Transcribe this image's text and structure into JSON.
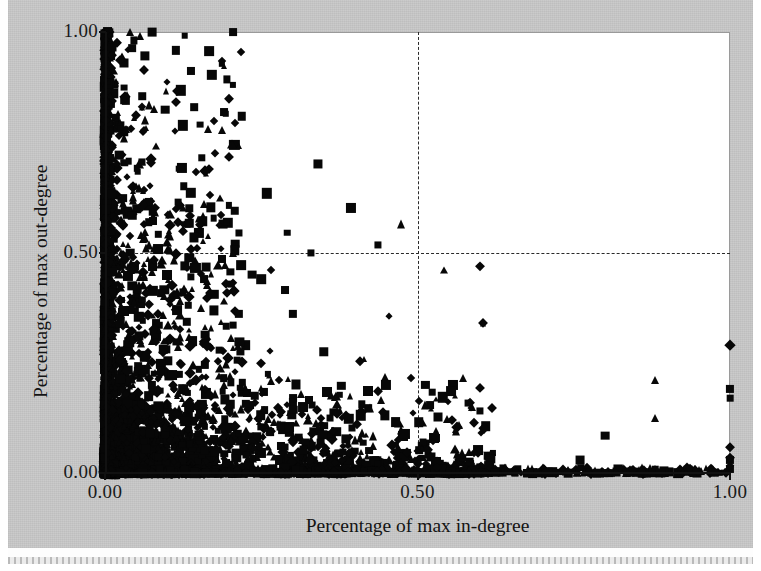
{
  "figure": {
    "background_color": "#c9c9c9",
    "plot_background_color": "#ffffff",
    "marker_color": "#070707",
    "gridline_color": "#2a2a2a"
  },
  "chart_data": {
    "type": "scatter",
    "title": "",
    "xlabel": "Percentage of max in-degree",
    "ylabel": "Percentage of max out-degree",
    "xlim": [
      0.0,
      1.0
    ],
    "ylim": [
      0.0,
      1.0
    ],
    "xticks": [
      "0.00",
      "0.50",
      "1.00"
    ],
    "yticks": [
      "0.00",
      "0.50",
      "1.00"
    ],
    "xtick_values": [
      0.0,
      0.5,
      1.0
    ],
    "ytick_values": [
      0.0,
      0.5,
      1.0
    ],
    "grid": true,
    "gridlines": {
      "x": [
        0.5
      ],
      "y": [
        0.5
      ],
      "style": "dashed"
    },
    "legend": "none",
    "marker_shapes": [
      "square",
      "diamond",
      "triangle"
    ],
    "series": [
      {
        "name": "square",
        "shape": "square",
        "points": [
          [
            0.0,
            1.0
          ],
          [
            0.004,
            1.0
          ],
          [
            0.075,
            1.0
          ],
          [
            0.205,
            1.0
          ],
          [
            0.03,
            0.93
          ],
          [
            0.03,
            0.845
          ],
          [
            0.03,
            0.775
          ],
          [
            0.205,
            0.88
          ],
          [
            0.152,
            0.79
          ],
          [
            0.0,
            0.76
          ],
          [
            0.0,
            0.745
          ],
          [
            0.003,
            0.7
          ],
          [
            0.118,
            0.69
          ],
          [
            0.34,
            0.7
          ],
          [
            0.208,
            0.595
          ],
          [
            0.0,
            0.64
          ],
          [
            0.026,
            0.62
          ],
          [
            0.068,
            0.605
          ],
          [
            0.135,
            0.6
          ],
          [
            0.0,
            0.57
          ],
          [
            0.15,
            0.545
          ],
          [
            0.208,
            0.52
          ],
          [
            0.208,
            0.505
          ],
          [
            0.0,
            0.505
          ],
          [
            0.04,
            0.5
          ],
          [
            0.33,
            0.5
          ],
          [
            0.128,
            0.47
          ],
          [
            0.0,
            0.455
          ],
          [
            0.158,
            0.44
          ],
          [
            0.235,
            0.45
          ],
          [
            0.25,
            0.44
          ],
          [
            0.0,
            0.42
          ],
          [
            0.095,
            0.415
          ],
          [
            0.175,
            0.405
          ],
          [
            0.05,
            0.395
          ],
          [
            0.0,
            0.38
          ],
          [
            0.115,
            0.37
          ],
          [
            0.3,
            0.36
          ],
          [
            0.0,
            0.35
          ],
          [
            0.06,
            0.345
          ],
          [
            0.205,
            0.335
          ],
          [
            0.0,
            0.32
          ],
          [
            0.082,
            0.31
          ],
          [
            0.14,
            0.3
          ],
          [
            0.0,
            0.295
          ],
          [
            0.225,
            0.29
          ],
          [
            0.03,
            0.28
          ],
          [
            0.35,
            0.275
          ],
          [
            0.0,
            0.265
          ],
          [
            0.1,
            0.255
          ],
          [
            0.16,
            0.245
          ],
          [
            0.0,
            0.235
          ],
          [
            0.055,
            0.23
          ],
          [
            0.26,
            0.225
          ],
          [
            0.19,
            0.215
          ],
          [
            0.0,
            0.205
          ],
          [
            0.075,
            0.2
          ],
          [
            0.125,
            0.19
          ],
          [
            0.42,
            0.185
          ],
          [
            0.0,
            0.18
          ],
          [
            0.24,
            0.175
          ],
          [
            0.04,
            0.165
          ],
          [
            0.3,
            0.16
          ],
          [
            0.155,
            0.155
          ],
          [
            0.0,
            0.15
          ],
          [
            0.09,
            0.145
          ],
          [
            0.2,
            0.14
          ],
          [
            0.52,
            0.155
          ],
          [
            0.0,
            0.13
          ],
          [
            0.06,
            0.125
          ],
          [
            0.36,
            0.125
          ],
          [
            0.14,
            0.118
          ],
          [
            0.0,
            0.11
          ],
          [
            0.25,
            0.105
          ],
          [
            0.105,
            0.1
          ],
          [
            0.18,
            0.095
          ],
          [
            0.0,
            0.09
          ],
          [
            0.045,
            0.085
          ],
          [
            0.31,
            0.08
          ],
          [
            0.8,
            0.085
          ],
          [
            0.0,
            0.075
          ],
          [
            0.13,
            0.07
          ],
          [
            0.22,
            0.065
          ],
          [
            0.07,
            0.06
          ],
          [
            0.0,
            0.055
          ],
          [
            0.165,
            0.05
          ],
          [
            0.4,
            0.05
          ],
          [
            0.62,
            0.045
          ],
          [
            0.0,
            0.04
          ],
          [
            0.095,
            0.035
          ],
          [
            0.28,
            0.03
          ],
          [
            0.76,
            0.03
          ],
          [
            0.0,
            0.025
          ],
          [
            0.05,
            0.02
          ],
          [
            0.2,
            0.018
          ],
          [
            0.34,
            0.015
          ],
          [
            0.48,
            0.012
          ],
          [
            0.56,
            0.01
          ],
          [
            0.66,
            0.01
          ],
          [
            0.88,
            0.008
          ],
          [
            1.0,
            0.19
          ],
          [
            1.0,
            0.17
          ],
          [
            1.0,
            0.03
          ],
          [
            1.0,
            0.01
          ],
          [
            0.015,
            0.88
          ],
          [
            0.015,
            0.69
          ],
          [
            0.015,
            0.53
          ],
          [
            0.015,
            0.33
          ],
          [
            0.008,
            0.96
          ],
          [
            0.008,
            0.6
          ],
          [
            0.008,
            0.43
          ],
          [
            0.008,
            0.215
          ]
        ]
      },
      {
        "name": "diamond",
        "shape": "diamond",
        "points": [
          [
            0.0,
            1.0
          ],
          [
            0.0,
            0.96
          ],
          [
            0.0,
            0.905
          ],
          [
            0.0,
            0.86
          ],
          [
            0.0,
            0.82
          ],
          [
            0.0,
            0.79
          ],
          [
            0.0,
            0.74
          ],
          [
            0.0,
            0.7
          ],
          [
            0.0,
            0.665
          ],
          [
            0.0,
            0.63
          ],
          [
            0.0,
            0.6
          ],
          [
            0.0,
            0.56
          ],
          [
            0.0,
            0.53
          ],
          [
            0.0,
            0.495
          ],
          [
            0.0,
            0.465
          ],
          [
            0.0,
            0.43
          ],
          [
            0.0,
            0.4
          ],
          [
            0.0,
            0.37
          ],
          [
            0.0,
            0.34
          ],
          [
            0.0,
            0.31
          ],
          [
            0.0,
            0.28
          ],
          [
            0.0,
            0.25
          ],
          [
            0.0,
            0.22
          ],
          [
            0.0,
            0.195
          ],
          [
            0.0,
            0.165
          ],
          [
            0.0,
            0.14
          ],
          [
            0.0,
            0.115
          ],
          [
            0.0,
            0.09
          ],
          [
            0.0,
            0.065
          ],
          [
            0.0,
            0.04
          ],
          [
            0.0,
            0.018
          ],
          [
            0.028,
            0.72
          ],
          [
            0.028,
            0.56
          ],
          [
            0.045,
            0.49
          ],
          [
            0.06,
            0.455
          ],
          [
            0.072,
            0.42
          ],
          [
            0.04,
            0.385
          ],
          [
            0.085,
            0.36
          ],
          [
            0.055,
            0.33
          ],
          [
            0.1,
            0.3
          ],
          [
            0.068,
            0.275
          ],
          [
            0.12,
            0.25
          ],
          [
            0.09,
            0.23
          ],
          [
            0.145,
            0.21
          ],
          [
            0.11,
            0.19
          ],
          [
            0.17,
            0.175
          ],
          [
            0.135,
            0.16
          ],
          [
            0.195,
            0.145
          ],
          [
            0.16,
            0.13
          ],
          [
            0.23,
            0.12
          ],
          [
            0.185,
            0.105
          ],
          [
            0.265,
            0.095
          ],
          [
            0.215,
            0.085
          ],
          [
            0.3,
            0.075
          ],
          [
            0.245,
            0.065
          ],
          [
            0.34,
            0.058
          ],
          [
            0.285,
            0.048
          ],
          [
            0.39,
            0.042
          ],
          [
            0.33,
            0.035
          ],
          [
            0.44,
            0.03
          ],
          [
            0.38,
            0.025
          ],
          [
            0.5,
            0.02
          ],
          [
            0.43,
            0.016
          ],
          [
            0.56,
            0.014
          ],
          [
            0.48,
            0.011
          ],
          [
            0.6,
            0.01
          ],
          [
            0.7,
            0.01
          ],
          [
            0.84,
            0.01
          ],
          [
            0.92,
            0.01
          ],
          [
            1.0,
            0.29
          ],
          [
            1.0,
            0.06
          ],
          [
            1.0,
            0.035
          ],
          [
            1.0,
            0.015
          ],
          [
            0.6,
            0.47
          ],
          [
            0.605,
            0.34
          ],
          [
            0.265,
            0.46
          ],
          [
            0.205,
            0.43
          ],
          [
            0.25,
            0.25
          ],
          [
            0.18,
            0.255
          ]
        ]
      },
      {
        "name": "triangle",
        "shape": "triangle",
        "points": [
          [
            0.04,
            1.0
          ],
          [
            0.035,
            0.86
          ],
          [
            0.03,
            0.76
          ],
          [
            0.055,
            0.7
          ],
          [
            0.0,
            0.81
          ],
          [
            0.0,
            0.68
          ],
          [
            0.0,
            0.545
          ],
          [
            0.0,
            0.48
          ],
          [
            0.0,
            0.415
          ],
          [
            0.0,
            0.345
          ],
          [
            0.0,
            0.29
          ],
          [
            0.0,
            0.23
          ],
          [
            0.0,
            0.175
          ],
          [
            0.0,
            0.125
          ],
          [
            0.0,
            0.08
          ],
          [
            0.0,
            0.03
          ],
          [
            0.06,
            0.64
          ],
          [
            0.1,
            0.54
          ],
          [
            0.205,
            0.5
          ],
          [
            0.075,
            0.455
          ],
          [
            0.12,
            0.39
          ],
          [
            0.16,
            0.33
          ],
          [
            0.095,
            0.3
          ],
          [
            0.14,
            0.245
          ],
          [
            0.19,
            0.2
          ],
          [
            0.115,
            0.175
          ],
          [
            0.23,
            0.15
          ],
          [
            0.165,
            0.13
          ],
          [
            0.28,
            0.11
          ],
          [
            0.21,
            0.09
          ],
          [
            0.33,
            0.075
          ],
          [
            0.26,
            0.06
          ],
          [
            0.395,
            0.048
          ],
          [
            0.31,
            0.038
          ],
          [
            0.455,
            0.03
          ],
          [
            0.37,
            0.024
          ],
          [
            0.53,
            0.018
          ],
          [
            0.44,
            0.014
          ],
          [
            0.64,
            0.012
          ],
          [
            0.56,
            0.01
          ],
          [
            0.74,
            0.01
          ],
          [
            0.86,
            0.01
          ],
          [
            0.88,
            0.21
          ],
          [
            0.88,
            0.125
          ],
          [
            0.95,
            0.01
          ],
          [
            0.605,
            0.34
          ]
        ]
      }
    ]
  }
}
